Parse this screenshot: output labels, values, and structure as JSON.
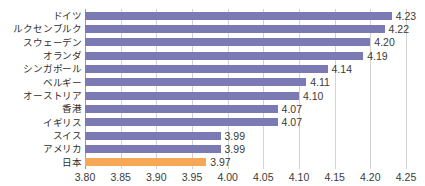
{
  "chart_data": {
    "type": "bar",
    "orientation": "horizontal",
    "title": "",
    "xlabel": "",
    "ylabel": "",
    "categories": [
      "ドイツ",
      "ルクセンブルク",
      "スウェーデン",
      "オランダ",
      "シンガポール",
      "ベルギー",
      "オーストリア",
      "香港",
      "イギリス",
      "スイス",
      "アメリカ",
      "日本"
    ],
    "values": [
      4.23,
      4.22,
      4.2,
      4.19,
      4.14,
      4.11,
      4.1,
      4.07,
      4.07,
      3.99,
      3.99,
      3.97
    ],
    "value_labels": [
      "4.23",
      "4.22",
      "4.20",
      "4.19",
      "4.14",
      "4.11",
      "4.10",
      "4.07",
      "4.07",
      "3.99",
      "3.99",
      "3.97"
    ],
    "highlight_index": 11,
    "xlim": [
      3.8,
      4.25
    ],
    "xticks": [
      3.8,
      3.85,
      3.9,
      3.95,
      4.0,
      4.05,
      4.1,
      4.15,
      4.2,
      4.25
    ],
    "xtick_labels": [
      "3.80",
      "3.85",
      "3.90",
      "3.95",
      "4.00",
      "4.05",
      "4.10",
      "4.15",
      "4.20",
      "4.25"
    ],
    "grid": true,
    "grid_axis": "x",
    "legend": false,
    "colors": {
      "bar": "#7b7ab5",
      "highlight_bar": "#f7a857",
      "gridline": "#d3d3d3",
      "axis": "#9a9a9a",
      "text": "#3a3a3a",
      "background": "#ffffff"
    }
  }
}
